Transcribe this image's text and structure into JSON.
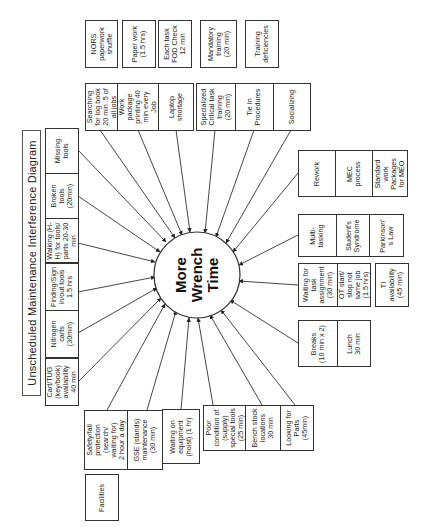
{
  "diagram": {
    "title": "Unscheduled Maintenance Interference Diagram",
    "center": "More\nWrench\nTime",
    "orientation": "rotated 90deg counter-clockwise",
    "groups": {
      "facilities_tools": [
        "Missing\ntools",
        "Broken\ntools\n(20min)",
        "Walking (H-\nH) for tools/\nparts 20-30\nmin",
        "Finding/Sign\nin/out tools\n1.5 hrs",
        "Nitrogen\ncarts\n(30min)",
        "Cart/TUG\n(key/book)\navailability\n40 min"
      ],
      "equipment": [
        "Safety/fall\nprotection\n(search/\nwaiting for)\n2 hour a day",
        "GSE (stands)\nmaintenance\n(30 min)",
        "Waiting on\nequipment\n(hoist) (1 hr)"
      ],
      "facilities_label": "Facilities",
      "parts": [
        "Poor\ncondition of\n(supply)\nspecial tools\n(25 min)",
        "Bench stock\nlocations\n30 min",
        "Looking for\nParts\n(45min)"
      ],
      "admin_top": [
        "NORS\npaperwork\nshuffle",
        "Paper work\n(1.5 hrs)",
        "Each task\nFOD Check\n12 min",
        "Mandatory\ntraining\n(20 min)",
        "Training\ndeficiencies"
      ],
      "admin_second": [
        "Searching\nfor log book\n20 min .5 of\nall jobs",
        "Work\npackage\nprinting 40\nmin every\nJob",
        "Laptop\nshortage",
        "Specialized\nCritical task\ntraining\n(20 min)",
        "Tie In\nProcedures",
        "Socializing"
      ],
      "process": [
        "Rework",
        "MEC\nprocess",
        "Standard\nwork\nPackages\nfor MEO"
      ],
      "behavior": [
        "Multi-\ntasking",
        "Student's\nSyndrome",
        "Parkinson'\ns Law"
      ],
      "scheduling": [
        "Waiting for\ntask\nassignment\n(30 min)",
        "OT start/\nstop not\nsame job\n(1.5 hrs)"
      ],
      "ti_availability": "TI\navailability\n(45 min)",
      "breaks": [
        "Breaks\n(10 min x 2)",
        "Lunch\n30 min"
      ]
    }
  }
}
